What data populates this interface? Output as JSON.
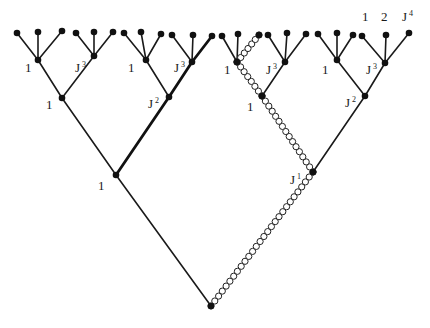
{
  "diagram": {
    "type": "tree",
    "colors": {
      "line": "#1a1a1a",
      "node": "#111111",
      "gluon": "#222222",
      "background": "#ffffff"
    },
    "top_labels": [
      {
        "text": "1",
        "sup": "",
        "x": 362,
        "y": 21
      },
      {
        "text": "2",
        "sup": "",
        "x": 381,
        "y": 21
      },
      {
        "text": "J",
        "sup": "4",
        "x": 402,
        "y": 21
      }
    ],
    "node_labels": [
      {
        "id": "L3a",
        "text": "1",
        "sup": "",
        "x": 25,
        "y": 72
      },
      {
        "id": "L3b",
        "text": "J",
        "sup": "3",
        "x": 75,
        "y": 72
      },
      {
        "id": "L3c",
        "text": "1",
        "sup": "",
        "x": 128,
        "y": 72
      },
      {
        "id": "L3d",
        "text": "J",
        "sup": "3",
        "x": 174,
        "y": 72
      },
      {
        "id": "L3e",
        "text": "1",
        "sup": "",
        "x": 224,
        "y": 74
      },
      {
        "id": "L3f",
        "text": "J",
        "sup": "3",
        "x": 266,
        "y": 74
      },
      {
        "id": "L3g",
        "text": "1",
        "sup": "",
        "x": 322,
        "y": 74
      },
      {
        "id": "L3h",
        "text": "J",
        "sup": "3",
        "x": 366,
        "y": 74
      },
      {
        "id": "L2a",
        "text": "1",
        "sup": "",
        "x": 46,
        "y": 109
      },
      {
        "id": "L2b",
        "text": "J",
        "sup": "2",
        "x": 148,
        "y": 108
      },
      {
        "id": "L2c",
        "text": "1",
        "sup": "",
        "x": 247,
        "y": 111
      },
      {
        "id": "L2d",
        "text": "J",
        "sup": "2",
        "x": 345,
        "y": 107
      },
      {
        "id": "L1a",
        "text": "1",
        "sup": "",
        "x": 98,
        "y": 190
      },
      {
        "id": "L1b",
        "text": "J",
        "sup": "1",
        "x": 290,
        "y": 184
      }
    ]
  }
}
